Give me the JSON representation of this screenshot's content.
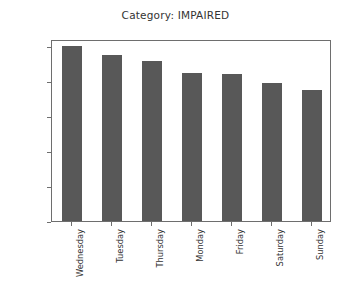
{
  "chart_data": {
    "type": "bar",
    "title": "Category: IMPAIRED",
    "xlabel": "",
    "ylabel": "",
    "categories": [
      "Wednesday",
      "Tuesday",
      "Thursday",
      "Monday",
      "Friday",
      "Saturday",
      "Sunday"
    ],
    "values": [
      25000,
      23700,
      22900,
      21100,
      21000,
      19700,
      18700
    ],
    "ylim": [
      0,
      26000
    ],
    "yticks": [
      0,
      5000,
      10000,
      15000,
      20000,
      25000
    ],
    "ytick_labels": [
      "0",
      "5000",
      "10000",
      "15000",
      "20000",
      "25000"
    ],
    "grid": false,
    "legend": null,
    "bar_color": "#585858",
    "axes_color": "#6e6e6e",
    "background": "#ffffff",
    "xtick_rotation": -90
  }
}
